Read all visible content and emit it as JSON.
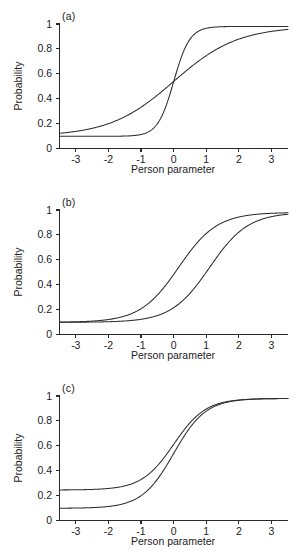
{
  "figure": {
    "background": "#ffffff",
    "curve_color": "#2e2e2e",
    "axis_color": "#2a2a2a"
  },
  "panels": [
    {
      "label": "(a)",
      "xlabel": "Person parameter",
      "ylabel": "Probability",
      "xticks": [
        "-3",
        "-2",
        "-1",
        "0",
        "1",
        "2",
        "3"
      ],
      "yticks": [
        "0",
        "0.2",
        "0.4",
        "0.6",
        "0.8",
        "1"
      ]
    },
    {
      "label": "(b)",
      "xlabel": "Person parameter",
      "ylabel": "Probability",
      "xticks": [
        "-3",
        "-2",
        "-1",
        "0",
        "1",
        "2",
        "3"
      ],
      "yticks": [
        "0",
        "0.2",
        "0.4",
        "0.6",
        "0.8",
        "1"
      ]
    },
    {
      "label": "(c)",
      "xlabel": "Person parameter",
      "ylabel": "Probability",
      "xticks": [
        "-3",
        "-2",
        "-1",
        "0",
        "1",
        "2",
        "3"
      ],
      "yticks": [
        "0",
        "0.2",
        "0.4",
        "0.6",
        "0.8",
        "1"
      ]
    }
  ],
  "chart_data": [
    {
      "type": "line",
      "title": "(a)",
      "xlabel": "Person parameter",
      "ylabel": "Probability",
      "xlim": [
        -3.5,
        3.5
      ],
      "ylim": [
        0,
        1.02
      ],
      "xticks": [
        -3,
        -2,
        -1,
        0,
        1,
        2,
        3
      ],
      "yticks": [
        0,
        0.2,
        0.4,
        0.6,
        0.8,
        1
      ],
      "grid": false,
      "legend": "none",
      "model": "3PL: P = c + (1-c)/(1+exp(-1.7*a*(theta-b)))",
      "series": [
        {
          "name": "high-discrimination",
          "params": {
            "a": 2.4,
            "b": 0.0,
            "c": 0.1
          },
          "x": [
            -3.5,
            -3.0,
            -2.5,
            -2.0,
            -1.5,
            -1.0,
            -0.75,
            -0.5,
            -0.25,
            0.0,
            0.25,
            0.5,
            0.75,
            1.0,
            1.5,
            2.0,
            2.5,
            3.0,
            3.5
          ],
          "y": [
            0.1,
            0.1,
            0.1,
            0.101,
            0.103,
            0.11,
            0.119,
            0.142,
            0.212,
            0.55,
            0.888,
            0.958,
            0.981,
            0.99,
            0.999,
            1.0,
            1.0,
            1.0,
            1.0
          ]
        },
        {
          "name": "low-discrimination",
          "params": {
            "a": 0.6,
            "b": 0.0,
            "c": 0.1
          },
          "x": [
            -3.5,
            -3.0,
            -2.5,
            -2.0,
            -1.5,
            -1.0,
            -0.75,
            -0.5,
            -0.25,
            0.0,
            0.25,
            0.5,
            0.75,
            1.0,
            1.5,
            2.0,
            2.5,
            3.0,
            3.5
          ],
          "y": [
            0.127,
            0.141,
            0.163,
            0.196,
            0.245,
            0.317,
            0.362,
            0.412,
            0.465,
            0.55,
            0.586,
            0.638,
            0.688,
            0.733,
            0.806,
            0.859,
            0.896,
            0.922,
            0.941
          ]
        }
      ]
    },
    {
      "type": "line",
      "title": "(b)",
      "xlabel": "Person parameter",
      "ylabel": "Probability",
      "xlim": [
        -3.5,
        3.5
      ],
      "ylim": [
        0,
        1.02
      ],
      "xticks": [
        -3,
        -2,
        -1,
        0,
        1,
        2,
        3
      ],
      "yticks": [
        0,
        0.2,
        0.4,
        0.6,
        0.8,
        1
      ],
      "grid": false,
      "legend": "none",
      "model": "2PL-with-guessing: P = c + (1-c)/(1+exp(-1.7*a*(theta-b)))",
      "series": [
        {
          "name": "easy-item",
          "params": {
            "a": 1.0,
            "b": 0.15,
            "c": 0.1
          },
          "x": [
            -3.5,
            -3.0,
            -2.5,
            -2.0,
            -1.5,
            -1.0,
            -0.5,
            0.0,
            0.5,
            1.0,
            1.5,
            2.0,
            2.5,
            3.0,
            3.5
          ],
          "y": [
            0.103,
            0.106,
            0.114,
            0.131,
            0.167,
            0.24,
            0.369,
            0.54,
            0.706,
            0.83,
            0.908,
            0.952,
            0.975,
            0.987,
            0.994
          ]
        },
        {
          "name": "hard-item",
          "params": {
            "a": 1.0,
            "b": 1.1,
            "c": 0.1
          },
          "x": [
            -3.5,
            -3.0,
            -2.5,
            -2.0,
            -1.5,
            -1.0,
            -0.5,
            0.0,
            0.5,
            1.0,
            1.5,
            2.0,
            2.5,
            3.0,
            3.5
          ],
          "y": [
            0.1,
            0.101,
            0.102,
            0.105,
            0.113,
            0.133,
            0.18,
            0.275,
            0.424,
            0.595,
            0.742,
            0.846,
            0.913,
            0.952,
            0.974
          ]
        }
      ]
    },
    {
      "type": "line",
      "title": "(c)",
      "xlabel": "Person parameter",
      "ylabel": "Probability",
      "xlim": [
        -3.5,
        3.5
      ],
      "ylim": [
        0,
        1.02
      ],
      "xticks": [
        -3,
        -2,
        -1,
        0,
        1,
        2,
        3
      ],
      "yticks": [
        0,
        0.2,
        0.4,
        0.6,
        0.8,
        1
      ],
      "grid": false,
      "legend": "none",
      "model": "3PL with differing guessing parameter c",
      "series": [
        {
          "name": "guessing-0.25",
          "params": {
            "a": 1.2,
            "b": 0.0,
            "c": 0.25
          },
          "x": [
            -3.5,
            -3.0,
            -2.5,
            -2.0,
            -1.5,
            -1.0,
            -0.5,
            0.0,
            0.5,
            1.0,
            1.5,
            2.0,
            2.5,
            3.0,
            3.5
          ],
          "y": [
            0.25,
            0.251,
            0.254,
            0.262,
            0.285,
            0.344,
            0.478,
            0.625,
            0.772,
            0.886,
            0.948,
            0.977,
            0.99,
            0.996,
            0.998
          ]
        },
        {
          "name": "guessing-0.10",
          "params": {
            "a": 1.2,
            "b": 0.0,
            "c": 0.1
          },
          "x": [
            -3.5,
            -3.0,
            -2.5,
            -2.0,
            -1.5,
            -1.0,
            -0.5,
            0.0,
            0.5,
            1.0,
            1.5,
            2.0,
            2.5,
            3.0,
            3.5
          ],
          "y": [
            0.1,
            0.101,
            0.105,
            0.116,
            0.147,
            0.226,
            0.404,
            0.6,
            0.796,
            0.948,
            0.964,
            0.987,
            0.995,
            0.998,
            0.999
          ]
        }
      ]
    }
  ]
}
